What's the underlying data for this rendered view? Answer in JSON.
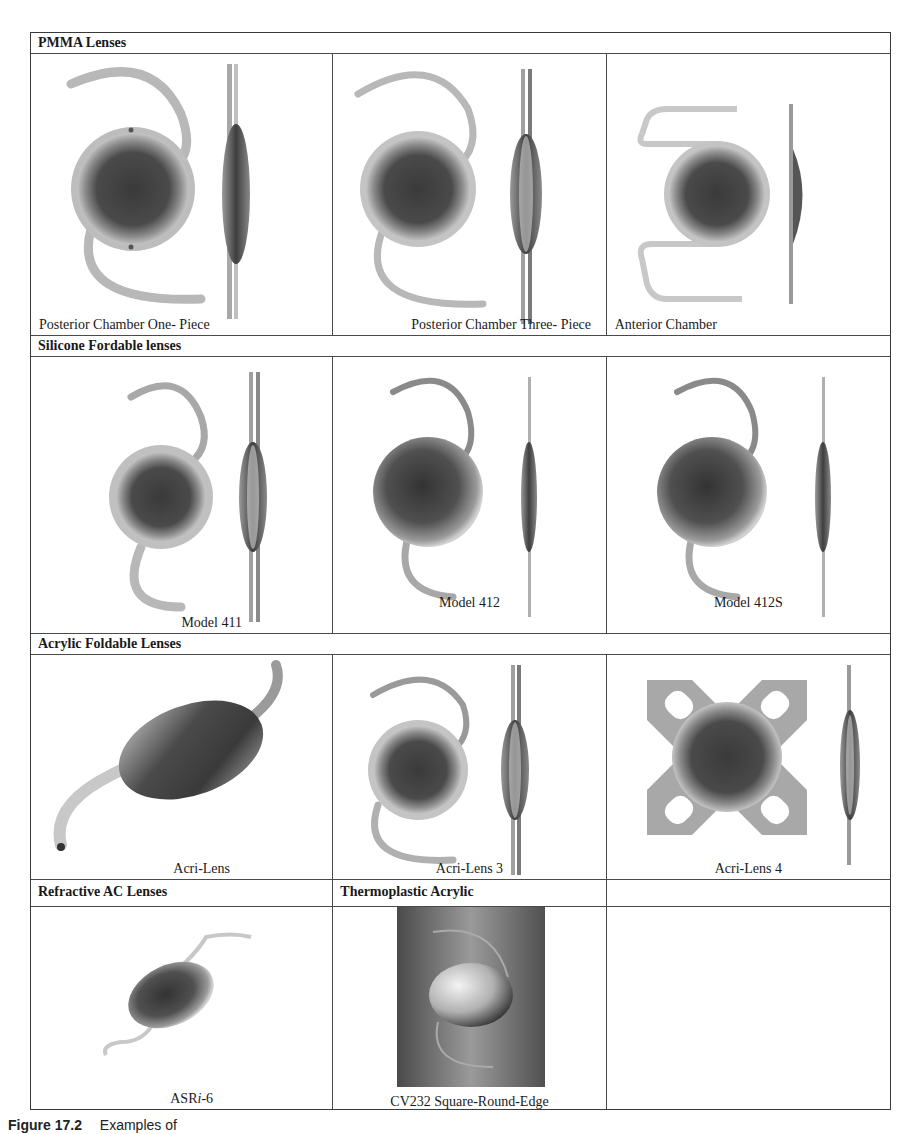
{
  "figure": {
    "sections": [
      {
        "header": "PMMA Lenses",
        "items": [
          {
            "caption": "Posterior Chamber One- Piece",
            "image": "pmma-posterior-one-piece-lens"
          },
          {
            "caption": "Posterior Chamber Three- Piece",
            "image": "pmma-posterior-three-piece-lens"
          },
          {
            "caption": "Anterior Chamber",
            "image": "pmma-anterior-chamber-lens"
          }
        ]
      },
      {
        "header": "Silicone Fordable lenses",
        "items": [
          {
            "caption": "Model 411",
            "image": "silicone-model-411-lens"
          },
          {
            "caption": "Model 412",
            "image": "silicone-model-412-lens"
          },
          {
            "caption": "Model 412S",
            "image": "silicone-model-412s-lens"
          }
        ]
      },
      {
        "header": "Acrylic Foldable Lenses",
        "items": [
          {
            "caption": "Acri-Lens",
            "image": "acri-lens"
          },
          {
            "caption": "Acri-Lens 3",
            "image": "acri-lens-3"
          },
          {
            "caption": "Acri-Lens 4",
            "image": "acri-lens-4"
          }
        ]
      },
      {
        "headers": [
          "Refractive AC Lenses",
          "Thermoplastic Acrylic",
          ""
        ],
        "items": [
          {
            "caption": "ASRi-6",
            "caption_parts": [
              "ASR",
              "i",
              "-6"
            ],
            "image": "asri-6-lens"
          },
          {
            "caption": "CV232  Square-Round-Edge",
            "image": "cv232-lens"
          },
          {
            "caption": "",
            "image": ""
          }
        ]
      }
    ],
    "caption_label": "Figure 17.2",
    "caption_text": "Examples of"
  },
  "colors": {
    "border": "#4a4a4a",
    "optic_dark": "#3c3c3c",
    "haptic": "#b8b8b8",
    "thermo_bg": "#6a6a6a"
  }
}
